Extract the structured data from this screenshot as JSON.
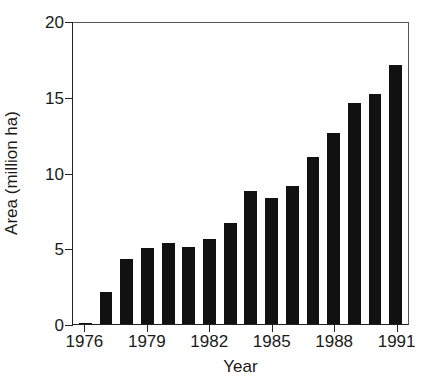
{
  "chart_data": {
    "type": "bar",
    "title": "",
    "xlabel": "Year",
    "ylabel": "Area (million ha)",
    "categories": [
      "1976",
      "1977",
      "1978",
      "1979",
      "1980",
      "1981",
      "1982",
      "1983",
      "1984",
      "1985",
      "1986",
      "1987",
      "1988",
      "1989",
      "1990",
      "1991"
    ],
    "values": [
      0.1,
      2.1,
      4.3,
      5.05,
      5.35,
      5.1,
      5.6,
      6.7,
      8.8,
      8.3,
      9.1,
      11.0,
      12.6,
      14.6,
      15.2,
      17.1
    ],
    "ylim": [
      0,
      20
    ],
    "ytick_values": [
      0,
      5,
      10,
      15,
      20
    ],
    "ytick_labels": [
      "0",
      "5",
      "10",
      "15",
      "20"
    ],
    "xtick_labels": [
      "1976",
      "1979",
      "1982",
      "1985",
      "1988",
      "1991"
    ],
    "xtick_categories": [
      "1976",
      "1979",
      "1982",
      "1985",
      "1988",
      "1991"
    ],
    "grid": false,
    "legend": "none",
    "bar_color": "#111111",
    "axis_color": "#222222",
    "background": "#ffffff"
  }
}
